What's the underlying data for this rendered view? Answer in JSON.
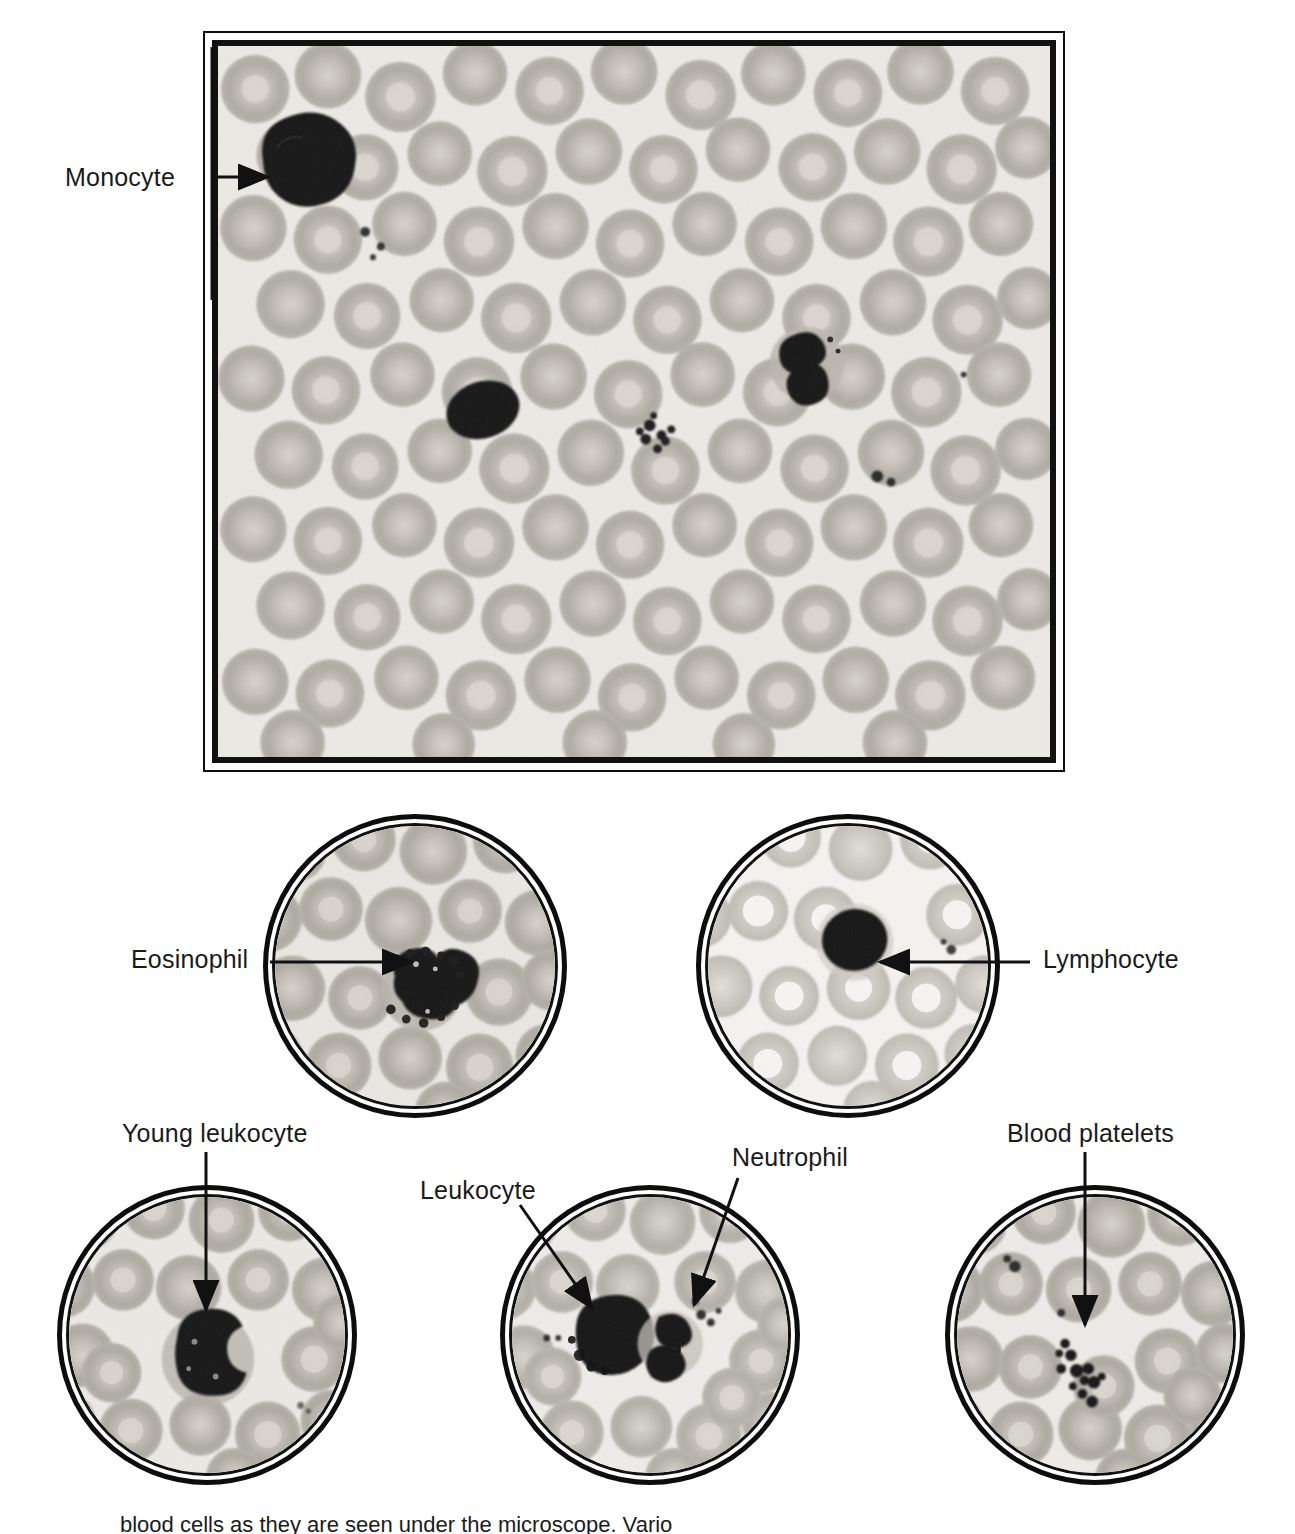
{
  "figure": {
    "kind": "blood-smear-micrograph-plate",
    "stain_tone": "#eceae5"
  },
  "main_plate": {
    "name": "main-blood-smear",
    "label": "Monocyte",
    "label_x": 65,
    "label_y": 163,
    "cells": [
      "monocyte",
      "lymphocyte",
      "neutrophil",
      "platelet-clump"
    ]
  },
  "circles": [
    {
      "id": "eosinophil-circle",
      "label": "Eosinophil",
      "label_x": 131,
      "label_y": 945,
      "cx": 415,
      "cy": 966,
      "r": 152,
      "arrow": "left-horizontal"
    },
    {
      "id": "lymphocyte-circle",
      "label": "Lymphocyte",
      "label_x": 1043,
      "label_y": 945,
      "cx": 848,
      "cy": 966,
      "r": 152,
      "arrow": "right-horizontal"
    },
    {
      "id": "young-leukocyte-circle",
      "label": "Young leukocyte",
      "label_x": 122,
      "label_y": 1119,
      "cx": 207,
      "cy": 1335,
      "r": 150,
      "arrow": "down-vertical"
    },
    {
      "id": "leukocyte-neutrophil-circle",
      "label": "Leukocyte",
      "label_x": 420,
      "label_y": 1176,
      "label2": "Neutrophil",
      "label2_x": 732,
      "label2_y": 1143,
      "cx": 650,
      "cy": 1335,
      "r": 150,
      "arrow": "two-diagonal"
    },
    {
      "id": "blood-platelets-circle",
      "label": "Blood platelets",
      "label_x": 1007,
      "label_y": 1119,
      "cx": 1095,
      "cy": 1335,
      "r": 150,
      "arrow": "down-vertical"
    }
  ],
  "caption": {
    "text": "blood cells as they are seen under the microscope. Vario"
  }
}
